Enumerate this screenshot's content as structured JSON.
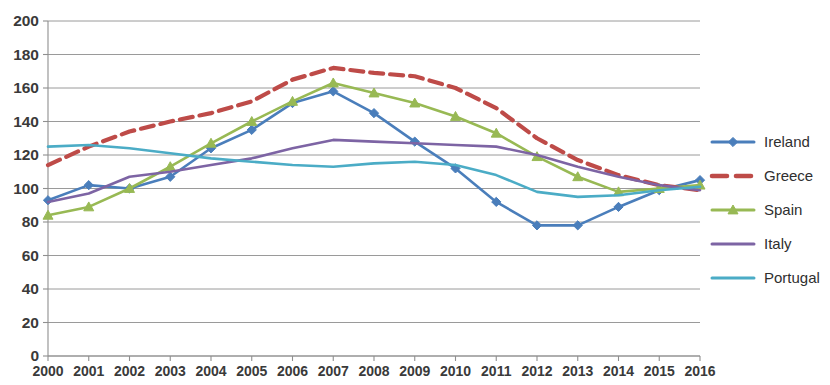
{
  "chart_data": {
    "type": "line",
    "title": "",
    "subtitle": "",
    "xlabel": "",
    "ylabel": "",
    "x": [
      2000,
      2001,
      2002,
      2003,
      2004,
      2005,
      2006,
      2007,
      2008,
      2009,
      2010,
      2011,
      2012,
      2013,
      2014,
      2015,
      2016
    ],
    "categories": [
      "2000",
      "2001",
      "2002",
      "2003",
      "2004",
      "2005",
      "2006",
      "2007",
      "2008",
      "2009",
      "2010",
      "2011",
      "2012",
      "2013",
      "2014",
      "2015",
      "2016"
    ],
    "xlim": [
      2000,
      2016
    ],
    "ylim": [
      0,
      200
    ],
    "ytick_labels": [
      "0",
      "20",
      "40",
      "60",
      "80",
      "100",
      "120",
      "140",
      "160",
      "180",
      "200"
    ],
    "yticks": [
      0,
      20,
      40,
      60,
      80,
      100,
      120,
      140,
      160,
      180,
      200
    ],
    "grid": true,
    "legend_position": "right",
    "series": [
      {
        "name": "Ireland",
        "color": "#4a7ebb",
        "marker": "diamond",
        "dashed": false,
        "values": [
          93,
          102,
          100,
          107,
          124,
          135,
          151,
          158,
          145,
          128,
          112,
          92,
          78,
          78,
          89,
          99,
          105
        ]
      },
      {
        "name": "Greece",
        "color": "#be4b48",
        "marker": "none",
        "dashed": true,
        "values": [
          114,
          125,
          134,
          140,
          145,
          152,
          165,
          172,
          169,
          167,
          160,
          148,
          130,
          117,
          108,
          102,
          99
        ]
      },
      {
        "name": "Spain",
        "color": "#98b954",
        "marker": "triangle",
        "dashed": false,
        "values": [
          84,
          89,
          100,
          113,
          127,
          140,
          152,
          163,
          157,
          151,
          143,
          133,
          119,
          107,
          98,
          100,
          102
        ]
      },
      {
        "name": "Italy",
        "color": "#7d64a4",
        "marker": "none",
        "dashed": false,
        "values": [
          92,
          97,
          107,
          110,
          114,
          118,
          124,
          129,
          128,
          127,
          126,
          125,
          120,
          113,
          107,
          102,
          99
        ]
      },
      {
        "name": "Portugal",
        "color": "#4bacc6",
        "marker": "none",
        "dashed": false,
        "values": [
          125,
          126,
          124,
          121,
          118,
          116,
          114,
          113,
          115,
          116,
          114,
          108,
          98,
          95,
          96,
          99,
          101
        ]
      }
    ]
  },
  "legend": {
    "items": [
      {
        "label": "Ireland"
      },
      {
        "label": "Greece"
      },
      {
        "label": "Spain"
      },
      {
        "label": "Italy"
      },
      {
        "label": "Portugal"
      }
    ]
  }
}
